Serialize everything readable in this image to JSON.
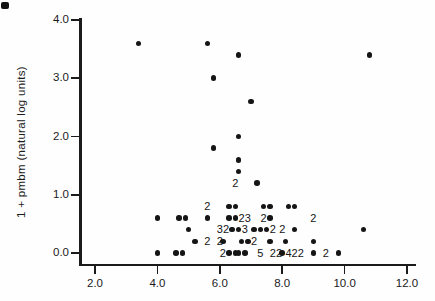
{
  "chart_data": {
    "type": "scatter",
    "title": "",
    "xlabel": "",
    "ylabel": "1 + pmbm (natural log units)",
    "xlim": [
      1.5,
      12.3
    ],
    "ylim": [
      -0.2,
      4.0
    ],
    "grid": false,
    "legend": "none",
    "marker_color": "#151515",
    "ink_color": "#1b1b1b",
    "x_ticks": [
      2.0,
      4.0,
      6.0,
      8.0,
      10.0,
      12.0
    ],
    "x_tick_labels": [
      "2.0",
      "4.0",
      "6.0",
      "8.0",
      "10.0",
      "12.0"
    ],
    "y_ticks": [
      0.0,
      1.0,
      2.0,
      3.0,
      4.0
    ],
    "y_tick_labels": [
      "0.0",
      "1.0",
      "2.0",
      "3.0",
      "4.0"
    ],
    "points": [
      [
        3.4,
        3.6
      ],
      [
        5.6,
        3.6
      ],
      [
        6.6,
        3.4
      ],
      [
        10.8,
        3.4
      ],
      [
        5.8,
        3.0
      ],
      [
        7.0,
        2.6
      ],
      [
        6.6,
        2.0
      ],
      [
        5.8,
        1.8
      ],
      [
        6.6,
        1.6
      ],
      [
        6.6,
        1.4
      ],
      [
        7.2,
        1.2
      ],
      [
        6.3,
        0.8
      ],
      [
        6.5,
        0.8
      ],
      [
        7.4,
        0.8
      ],
      [
        7.6,
        0.8
      ],
      [
        8.2,
        0.8
      ],
      [
        8.4,
        0.8
      ],
      [
        4.0,
        0.6
      ],
      [
        4.7,
        0.6
      ],
      [
        4.9,
        0.6
      ],
      [
        5.6,
        0.6
      ],
      [
        6.3,
        0.6
      ],
      [
        6.5,
        0.6
      ],
      [
        7.6,
        0.6
      ],
      [
        5.0,
        0.4
      ],
      [
        6.4,
        0.4
      ],
      [
        6.6,
        0.4
      ],
      [
        7.1,
        0.4
      ],
      [
        7.3,
        0.4
      ],
      [
        7.5,
        0.4
      ],
      [
        8.4,
        0.4
      ],
      [
        10.6,
        0.4
      ],
      [
        5.2,
        0.2
      ],
      [
        6.1,
        0.2
      ],
      [
        6.7,
        0.2
      ],
      [
        6.9,
        0.2
      ],
      [
        7.6,
        0.2
      ],
      [
        8.1,
        0.2
      ],
      [
        9.0,
        0.2
      ],
      [
        4.0,
        0.0
      ],
      [
        4.6,
        0.0
      ],
      [
        4.8,
        0.0
      ],
      [
        6.3,
        0.0
      ],
      [
        6.5,
        0.0
      ],
      [
        6.6,
        0.0
      ],
      [
        6.8,
        0.0
      ],
      [
        8.0,
        0.0
      ],
      [
        9.0,
        0.0
      ],
      [
        9.8,
        0.0
      ]
    ],
    "count_labels": [
      {
        "x": 6.5,
        "y": 1.2,
        "text": "2"
      },
      {
        "x": 5.6,
        "y": 0.8,
        "text": "2"
      },
      {
        "x": 6.7,
        "y": 0.6,
        "text": "2"
      },
      {
        "x": 6.9,
        "y": 0.6,
        "text": "3"
      },
      {
        "x": 7.4,
        "y": 0.6,
        "text": "2"
      },
      {
        "x": 9.0,
        "y": 0.6,
        "text": "2"
      },
      {
        "x": 6.0,
        "y": 0.4,
        "text": "3"
      },
      {
        "x": 6.2,
        "y": 0.4,
        "text": "2"
      },
      {
        "x": 6.8,
        "y": 0.4,
        "text": "3"
      },
      {
        "x": 7.7,
        "y": 0.4,
        "text": "2"
      },
      {
        "x": 8.0,
        "y": 0.4,
        "text": "2"
      },
      {
        "x": 5.6,
        "y": 0.2,
        "text": "2"
      },
      {
        "x": 6.0,
        "y": 0.2,
        "text": "2"
      },
      {
        "x": 7.1,
        "y": 0.2,
        "text": "2"
      },
      {
        "x": 6.1,
        "y": 0.0,
        "text": "2"
      },
      {
        "x": 7.3,
        "y": 0.0,
        "text": "5"
      },
      {
        "x": 7.7,
        "y": 0.0,
        "text": "2"
      },
      {
        "x": 7.9,
        "y": 0.0,
        "text": "2"
      },
      {
        "x": 8.2,
        "y": 0.0,
        "text": "4"
      },
      {
        "x": 8.4,
        "y": 0.0,
        "text": "2"
      },
      {
        "x": 8.6,
        "y": 0.0,
        "text": "2"
      },
      {
        "x": 9.4,
        "y": 0.0,
        "text": "2"
      }
    ]
  }
}
